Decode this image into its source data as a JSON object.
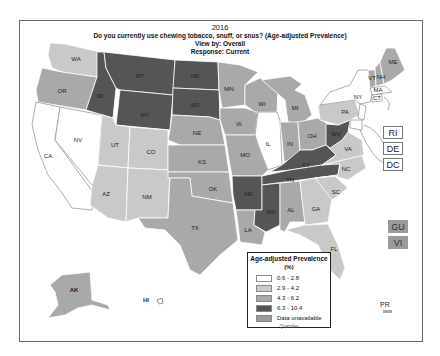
{
  "title": {
    "year": "2016",
    "question": "Do you currently use chewing tobacco, snuff, or snus? (Age-adjusted Prevalence)",
    "view_by": "View by: Overall",
    "response": "Response: Current"
  },
  "colors": {
    "q1": "#ffffff",
    "q2": "#c9c9c9",
    "q3": "#a9a9a9",
    "q4": "#555555",
    "unavailable": "#9a9a9a",
    "border": "#ffffff"
  },
  "legend": {
    "title": "Age-adjusted Prevalence",
    "unit": "(%)",
    "items": [
      {
        "label": "0.6 - 2.8",
        "color": "#ffffff"
      },
      {
        "label": "2.9 - 4.2",
        "color": "#c9c9c9"
      },
      {
        "label": "4.3 - 6.2",
        "color": "#a9a9a9"
      },
      {
        "label": "6.3 - 10.4",
        "color": "#555555"
      },
      {
        "label": "Data unavailable",
        "color": "#9a9a9a"
      }
    ],
    "footer": "Quantiles"
  },
  "territories": {
    "ri": "RI",
    "de": "DE",
    "dc": "DC",
    "gu": "GU",
    "vi": "VI",
    "pr": "PR",
    "ak": "AK",
    "hi": "HI"
  },
  "states": {
    "WA": "q2",
    "OR": "q3",
    "CA": "q1",
    "NV": "q1",
    "ID": "q4",
    "MT": "q4",
    "WY": "q4",
    "UT": "q2",
    "CO": "q2",
    "AZ": "q2",
    "NM": "q2",
    "ND": "q4",
    "SD": "q4",
    "NE": "q3",
    "KS": "q3",
    "OK": "q3",
    "TX": "q3",
    "MN": "q3",
    "IA": "q3",
    "MO": "q3",
    "AR": "q4",
    "LA": "q3",
    "WI": "q3",
    "IL": "q1",
    "MI": "q3",
    "IN": "q3",
    "OH": "q3",
    "KY": "q4",
    "TN": "q4",
    "MS": "q4",
    "AL": "q3",
    "GA": "q2",
    "FL": "q2",
    "SC": "q2",
    "NC": "q2",
    "VA": "q2",
    "WV": "q4",
    "PA": "q2",
    "NY": "q1",
    "VT": "q3",
    "NH": "q3",
    "ME": "q3",
    "MA": "q1",
    "CT": "q1",
    "NJ": "q1",
    "MD": "q1",
    "AK": "q3",
    "HI": "q1"
  }
}
